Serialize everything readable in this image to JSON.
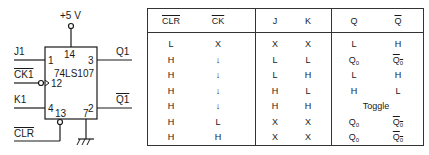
{
  "schematic": {
    "chip": "74LS107",
    "supply": "+5 V",
    "pins": {
      "vcc": "14",
      "j": "1",
      "clk": "12",
      "k": "4",
      "clr": "13",
      "gnd": "7",
      "q": "3",
      "qbar": "2"
    },
    "signals": {
      "j": "J1",
      "clk": "CK1",
      "k": "K1",
      "clr": "CLR",
      "q": "Q1",
      "qbar": "Q1"
    }
  },
  "truth_table": {
    "headers": [
      "CLR",
      "CK",
      "J",
      "K",
      "Q",
      "Q"
    ],
    "rows": [
      [
        "L",
        "X",
        "X",
        "X",
        "L",
        "H"
      ],
      [
        "H",
        "↓",
        "L",
        "L",
        "Q0",
        "Q0"
      ],
      [
        "H",
        "↓",
        "L",
        "H",
        "L",
        "H"
      ],
      [
        "H",
        "↓",
        "H",
        "L",
        "H",
        "L"
      ],
      [
        "H",
        "↓",
        "H",
        "H",
        "Toggle",
        ""
      ],
      [
        "H",
        "L",
        "X",
        "X",
        "Q0",
        "Q0"
      ],
      [
        "H",
        "H",
        "X",
        "X",
        "Q0",
        "Q0"
      ]
    ]
  }
}
